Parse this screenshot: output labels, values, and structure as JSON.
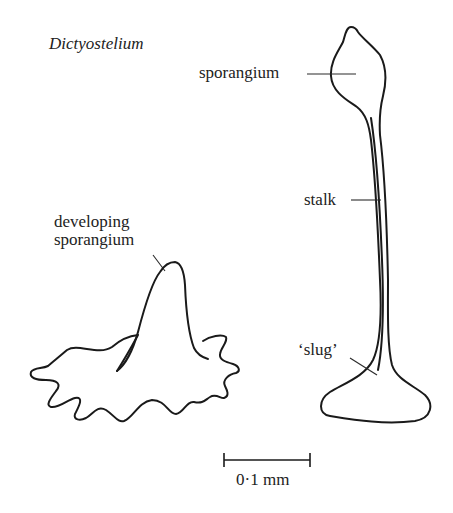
{
  "title": "Dictyostelium",
  "labels": {
    "sporangium": "sporangium",
    "stalk": "stalk",
    "slug": "‘slug’",
    "developing_line1": "developing",
    "developing_line2": "sporangium"
  },
  "scale_bar": {
    "label": "0·1 mm"
  },
  "colors": {
    "line": "#1a1a1a",
    "text": "#222222",
    "background": "#ffffff"
  }
}
